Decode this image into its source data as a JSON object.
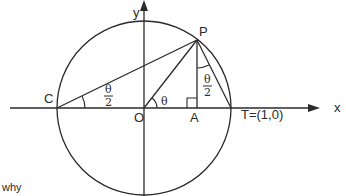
{
  "diagram": {
    "axes": {
      "x_label": "x",
      "y_label": "y"
    },
    "points": {
      "C": "C",
      "O": "O",
      "A": "A",
      "P": "P",
      "T": "T=(1,0)"
    },
    "angles": {
      "at_O": "θ",
      "at_C_num": "θ",
      "at_C_den": "2",
      "at_P_num": "θ",
      "at_P_den": "2"
    },
    "colors": {
      "stroke": "#2a2a2a",
      "background": "#ffffff"
    }
  },
  "caption_fragment": "why"
}
